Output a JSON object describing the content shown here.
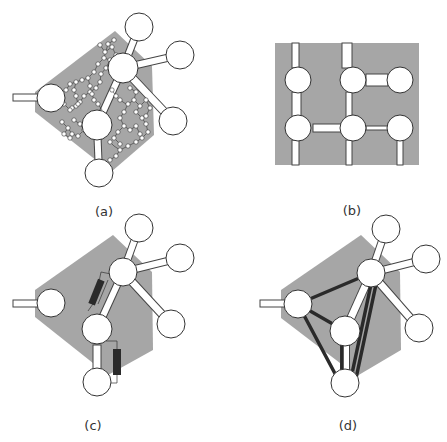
{
  "figure": {
    "background": "#ffffff",
    "region_color": "#a6a6a6",
    "node_fill": "#ffffff",
    "stroke_color": "#333333",
    "dark_element_color": "#2a2a2a",
    "panels": [
      {
        "id": "a",
        "label": "(a)",
        "description": "coarse nodes with fine-grained atomistic network inside gray region"
      },
      {
        "id": "b",
        "label": "(b)",
        "description": "regular lattice of 6 nodes on gray rectangle"
      },
      {
        "id": "c",
        "label": "(c)",
        "description": "coarse nodes with two dark spring/resistor elements"
      },
      {
        "id": "d",
        "label": "(d)",
        "description": "coarse nodes with dark connecting rods forming network"
      }
    ]
  }
}
